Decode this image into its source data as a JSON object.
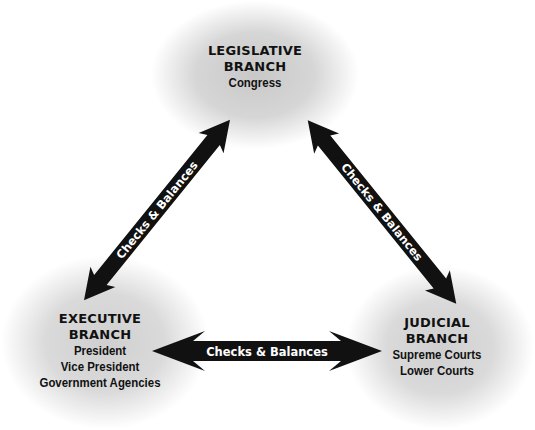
{
  "diagram": {
    "nodes": [
      {
        "id": "legislative",
        "title_lines": [
          "LEGISLATIVE",
          "BRANCH"
        ],
        "members": [
          "Congress"
        ]
      },
      {
        "id": "executive",
        "title_lines": [
          "EXECUTIVE",
          "BRANCH"
        ],
        "members": [
          "President",
          "Vice President",
          "Government Agencies"
        ]
      },
      {
        "id": "judicial",
        "title_lines": [
          "JUDICIAL",
          "BRANCH"
        ],
        "members": [
          "Supreme Courts",
          "Lower Courts"
        ]
      }
    ],
    "edges": [
      {
        "from": "executive",
        "to": "legislative",
        "label": "Checks & Balances",
        "bidirectional": true
      },
      {
        "from": "legislative",
        "to": "judicial",
        "label": "Checks & Balances",
        "bidirectional": true
      },
      {
        "from": "executive",
        "to": "judicial",
        "label": "Checks & Balances",
        "bidirectional": true
      }
    ]
  },
  "colors": {
    "arrow": "#111111",
    "label_text": "#ffffff",
    "node_text": "#111111",
    "blob": "#cccccc"
  }
}
